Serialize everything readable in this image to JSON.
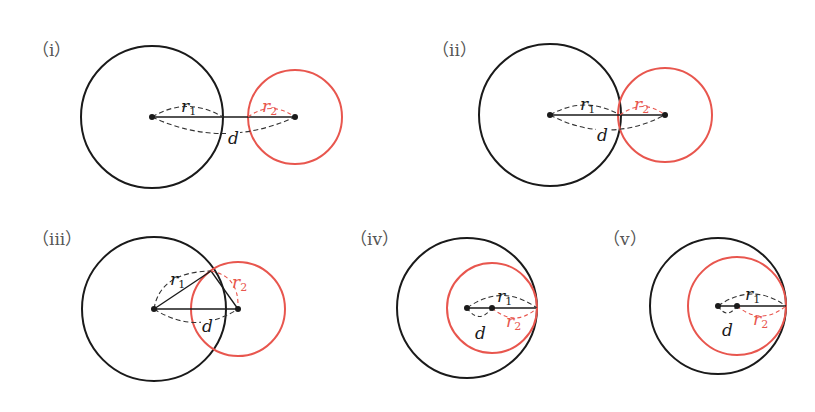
{
  "colors": {
    "circle1": "#1a1a1a",
    "circle2": "#e8564e",
    "dash": "#333333",
    "label": "#555555"
  },
  "variables": {
    "r": "r",
    "sub1": "1",
    "sub2": "2",
    "d": "d"
  },
  "panels": [
    {
      "label": "（i）",
      "case": "separate",
      "c1": {
        "x": 152,
        "y": 117,
        "r": 71
      },
      "c2": {
        "x": 295,
        "y": 117,
        "r": 47
      }
    },
    {
      "label": "（ii）",
      "case": "externally-tangent",
      "c1": {
        "x": 550,
        "y": 115,
        "r": 71
      },
      "c2": {
        "x": 665,
        "y": 115,
        "r": 47
      }
    },
    {
      "label": "（iii）",
      "case": "intersecting",
      "c1": {
        "x": 154,
        "y": 309,
        "r": 72
      },
      "c2": {
        "x": 238,
        "y": 309,
        "r": 47
      }
    },
    {
      "label": "（iv）",
      "case": "internally-tangent",
      "c1": {
        "x": 467,
        "y": 308,
        "r": 70
      },
      "c2": {
        "x": 492,
        "y": 308,
        "r": 45
      }
    },
    {
      "label": "（v）",
      "case": "internally-tangent",
      "c1": {
        "x": 718,
        "y": 306,
        "r": 68
      },
      "c2": {
        "x": 737,
        "y": 306,
        "r": 49
      }
    }
  ]
}
